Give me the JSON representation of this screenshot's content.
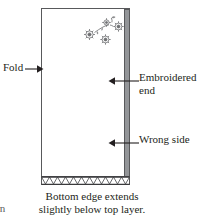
{
  "figure": {
    "type": "sewing-diagram",
    "colors": {
      "outline": "#58595b",
      "edge_band": "#939598",
      "text": "#231f20",
      "background": "#ffffff"
    }
  },
  "annotations": {
    "fold": {
      "label": "Fold",
      "arrow_direction": "right",
      "points_to": "left-edge-of-fabric"
    },
    "embroidered_end": {
      "label_line_1": "Embroidered",
      "label_line_2": "end",
      "arrow_direction": "left",
      "points_to": "right-edge-band"
    },
    "wrong_side": {
      "label": "Wrong side",
      "arrow_direction": "left",
      "points_to": "right-edge-band"
    }
  },
  "caption": {
    "line_1": "Bottom edge extends",
    "line_2": "slightly below top layer."
  },
  "edge_fragment": {
    "text": "rn"
  },
  "motif": {
    "name": "embroidered-floral-motif",
    "element_count": 5
  },
  "bottom_edge": {
    "name": "zigzag-stitched-edge",
    "teeth": 11
  }
}
